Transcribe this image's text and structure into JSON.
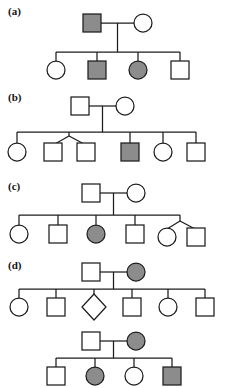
{
  "figure": {
    "background_color": "#ffffff",
    "line_color": "#1d1d1a",
    "affected_fill": "#8c8c8c",
    "unaffected_fill": "#ffffff",
    "symbol_size_px": 18
  },
  "panels": [
    {
      "id": "a",
      "label": "(a)",
      "generations": [
        {
          "name": "generation-1",
          "individuals": [
            {
              "sex": "male",
              "shape": "square",
              "status": "affected"
            },
            {
              "sex": "female",
              "shape": "circle",
              "status": "unaffected"
            }
          ]
        },
        {
          "name": "generation-2",
          "individuals": [
            {
              "sex": "female",
              "shape": "circle",
              "status": "unaffected"
            },
            {
              "sex": "male",
              "shape": "square",
              "status": "affected"
            },
            {
              "sex": "female",
              "shape": "circle",
              "status": "affected"
            },
            {
              "sex": "male",
              "shape": "square",
              "status": "unaffected"
            }
          ]
        }
      ],
      "counts": {
        "individuals": 6,
        "affected": 3,
        "matings": 1,
        "children": 4
      }
    },
    {
      "id": "b",
      "label": "(b)",
      "generations": [
        {
          "name": "generation-1",
          "individuals": [
            {
              "sex": "male",
              "shape": "square",
              "status": "unaffected"
            },
            {
              "sex": "female",
              "shape": "circle",
              "status": "unaffected"
            }
          ]
        },
        {
          "name": "generation-2",
          "individuals": [
            {
              "sex": "female",
              "shape": "circle",
              "status": "unaffected",
              "twin": false
            },
            {
              "sex": "male",
              "shape": "square",
              "status": "unaffected",
              "twin": true
            },
            {
              "sex": "male",
              "shape": "square",
              "status": "unaffected",
              "twin": true
            },
            {
              "sex": "male",
              "shape": "square",
              "status": "affected",
              "twin": false
            },
            {
              "sex": "female",
              "shape": "circle",
              "status": "unaffected",
              "twin": false
            },
            {
              "sex": "male",
              "shape": "square",
              "status": "unaffected",
              "twin": false
            }
          ]
        }
      ],
      "counts": {
        "individuals": 8,
        "affected": 1,
        "matings": 1,
        "children": 6,
        "twin_pairs": 1
      }
    },
    {
      "id": "c",
      "label": "(c)",
      "generations": [
        {
          "name": "generation-1",
          "individuals": [
            {
              "sex": "male",
              "shape": "square",
              "status": "unaffected"
            },
            {
              "sex": "female",
              "shape": "circle",
              "status": "unaffected"
            }
          ]
        },
        {
          "name": "generation-2",
          "individuals": [
            {
              "sex": "female",
              "shape": "circle",
              "status": "unaffected",
              "role": "child"
            },
            {
              "sex": "male",
              "shape": "square",
              "status": "unaffected",
              "role": "child"
            },
            {
              "sex": "female",
              "shape": "circle",
              "status": "affected",
              "role": "child"
            },
            {
              "sex": "male",
              "shape": "square",
              "status": "unaffected",
              "role": "child"
            },
            {
              "sex": "female",
              "shape": "circle",
              "status": "unaffected",
              "role": "child"
            },
            {
              "sex": "male",
              "shape": "square",
              "status": "unaffected",
              "role": "spouse"
            }
          ]
        }
      ],
      "counts": {
        "individuals": 8,
        "affected": 1,
        "matings": 2,
        "children": 5
      }
    },
    {
      "id": "d",
      "label": "(d)",
      "generations": [
        {
          "name": "generation-1",
          "individuals": [
            {
              "sex": "male",
              "shape": "square",
              "status": "unaffected"
            },
            {
              "sex": "female",
              "shape": "circle",
              "status": "affected"
            }
          ]
        },
        {
          "name": "generation-2",
          "individuals": [
            {
              "sex": "female",
              "shape": "circle",
              "status": "unaffected"
            },
            {
              "sex": "male",
              "shape": "square",
              "status": "unaffected"
            },
            {
              "sex": "unknown",
              "shape": "diamond",
              "status": "unaffected"
            },
            {
              "sex": "male",
              "shape": "square",
              "status": "unaffected"
            },
            {
              "sex": "female",
              "shape": "circle",
              "status": "unaffected"
            },
            {
              "sex": "male",
              "shape": "square",
              "status": "unaffected"
            }
          ]
        },
        {
          "name": "generation-3",
          "individuals": [
            {
              "sex": "male",
              "shape": "square",
              "status": "unaffected"
            },
            {
              "sex": "female",
              "shape": "circle",
              "status": "affected"
            }
          ]
        },
        {
          "name": "generation-4",
          "individuals": [
            {
              "sex": "male",
              "shape": "square",
              "status": "unaffected"
            },
            {
              "sex": "female",
              "shape": "circle",
              "status": "affected"
            },
            {
              "sex": "female",
              "shape": "circle",
              "status": "unaffected"
            },
            {
              "sex": "male",
              "shape": "square",
              "status": "affected"
            }
          ]
        }
      ],
      "counts": {
        "individuals": 14,
        "affected": 4,
        "matings": 2,
        "children": 10
      }
    }
  ],
  "legend": {
    "square": "male",
    "circle": "female",
    "diamond": "sex unknown",
    "filled": "affected",
    "open": "unaffected"
  }
}
